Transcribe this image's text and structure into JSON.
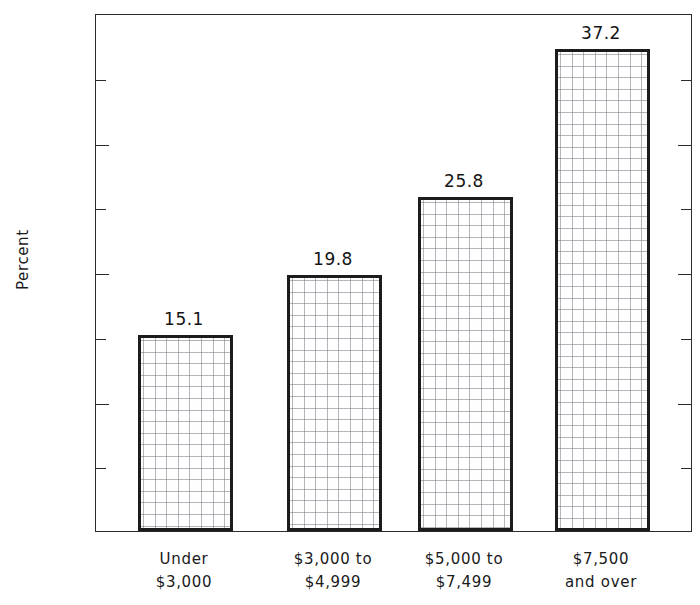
{
  "chart_data": {
    "type": "bar",
    "title": "",
    "subtitle": "",
    "xlabel": "",
    "ylabel": "Percent",
    "categories": [
      "Under\n$3,000",
      "$3,000 to\n$4,999",
      "$5,000 to\n$7,499",
      "$7,500\nand over"
    ],
    "category_lines": [
      [
        "Under",
        "$3,000"
      ],
      [
        "$3,000 to",
        "$4,999"
      ],
      [
        "$5,000 to",
        "$7,499"
      ],
      [
        "$7,500",
        "and over"
      ]
    ],
    "values": [
      15.1,
      19.8,
      25.8,
      37.2
    ],
    "value_labels": [
      "15.1",
      "19.8",
      "25.8",
      "37.2"
    ],
    "ylim": [
      0,
      40
    ],
    "y_major_ticks": [
      0,
      10,
      20,
      30,
      40
    ],
    "y_major_tick_labels": [
      "0",
      "10",
      "20",
      "30",
      "40"
    ],
    "y_minor_ticks": [
      5,
      15,
      25,
      35
    ],
    "grid": false,
    "legend": null,
    "bar_fill": "fine-grid-hatch",
    "bar_edge_color": "#1c1c1c",
    "axis_color": "#2b2b2b",
    "background_color": "#ffffff"
  }
}
